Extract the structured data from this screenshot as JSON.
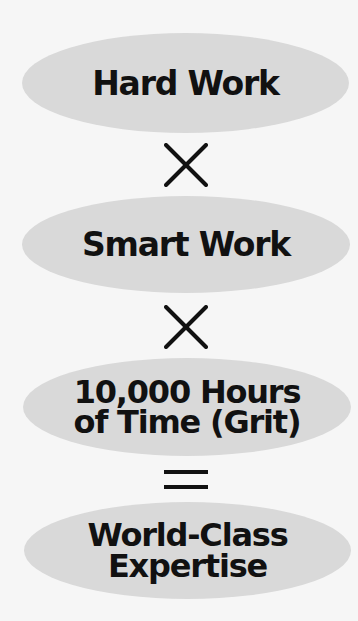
{
  "diagram": {
    "type": "equation-flow",
    "colors": {
      "background": "#f6f6f6",
      "ellipse_fill": "#d9d9d9",
      "text": "#111111",
      "operator": "#111111"
    },
    "terms": [
      {
        "lines": [
          "Hard Work"
        ]
      },
      {
        "lines": [
          "Smart Work"
        ]
      },
      {
        "lines": [
          "10,000 Hours",
          "of Time (Grit)"
        ]
      },
      {
        "lines": [
          "World-Class",
          "Expertise"
        ]
      }
    ],
    "operators": [
      {
        "symbol": "×",
        "name": "multiply"
      },
      {
        "symbol": "×",
        "name": "multiply"
      },
      {
        "symbol": "=",
        "name": "equals"
      }
    ]
  }
}
